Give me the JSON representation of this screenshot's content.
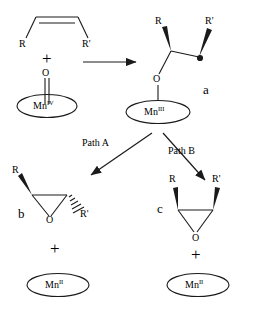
{
  "scheme": {
    "title": "Manganese-oxo mediated alkene epoxidation mechanism",
    "width": 255,
    "height": 309,
    "line_color": "#1a1a1a",
    "text_color": "#000000",
    "background": "#ffffff"
  },
  "reactants": {
    "alkene": {
      "name": "cis-alkene",
      "left_substituent": "R",
      "right_substituent": "R'",
      "geometry": "cis"
    },
    "plus_sign": "+",
    "oxidant": {
      "oxo_label": "O",
      "metal": "Mn",
      "oxidation_state": "IV",
      "bond_type": "double"
    }
  },
  "arrow_main": {
    "name": "reaction-arrow",
    "label": ""
  },
  "intermediate": {
    "id": "a",
    "left_substituent": "R",
    "right_substituent": "R'",
    "radical_marker": "•",
    "oxygen_label": "O",
    "metal": "Mn",
    "oxidation_state": "III",
    "left_wedge": "bold",
    "right_wedge": "bold"
  },
  "branches": [
    {
      "name": "path-a",
      "label": "Path A",
      "product_id": "b"
    },
    {
      "name": "path-b",
      "label": "Path B",
      "product_id": "c"
    }
  ],
  "products": {
    "b": {
      "id": "b",
      "name": "trans-epoxide",
      "left_substituent": "R",
      "right_substituent": "R'",
      "left_bond_style": "bold-wedge",
      "right_bond_style": "hashed-wedge",
      "oxygen_label": "O",
      "plus_sign": "+",
      "metal": "Mn",
      "oxidation_state": "II"
    },
    "c": {
      "id": "c",
      "name": "cis-epoxide",
      "left_substituent": "R",
      "right_substituent": "R'",
      "left_bond_style": "bold-wedge",
      "right_bond_style": "bold-wedge",
      "oxygen_label": "O",
      "plus_sign": "+",
      "metal": "Mn",
      "oxidation_state": "II"
    }
  }
}
